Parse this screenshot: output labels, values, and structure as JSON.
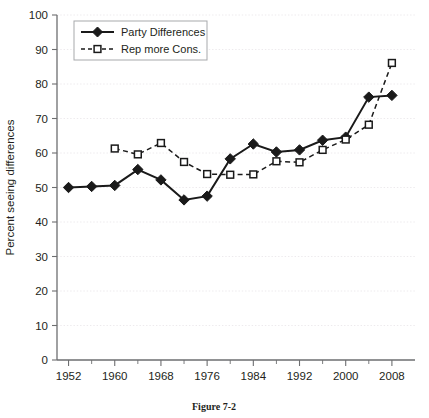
{
  "figure": {
    "caption": "Figure 7-2"
  },
  "chart_data": {
    "type": "line",
    "title": "",
    "xlabel": "",
    "ylabel": "Percent seeing differences",
    "xlim": [
      1950,
      2012
    ],
    "ylim": [
      0,
      100
    ],
    "ytick_step": 10,
    "yticks": [
      0,
      10,
      20,
      30,
      40,
      50,
      60,
      70,
      80,
      90,
      100
    ],
    "ytick_labels": [
      "0",
      "10",
      "20",
      "30",
      "40",
      "50",
      "60",
      "70",
      "80",
      "90",
      "100"
    ],
    "xticks": [
      1952,
      1956,
      1960,
      1964,
      1968,
      1972,
      1976,
      1980,
      1984,
      1988,
      1992,
      1996,
      2000,
      2004,
      2008
    ],
    "xtick_labels_major": [
      "1952",
      "1960",
      "1968",
      "1976",
      "1984",
      "1992",
      "2000",
      "2008"
    ],
    "xticks_major": [
      1952,
      1960,
      1968,
      1976,
      1984,
      1992,
      2000,
      2008
    ],
    "grid": true,
    "grid_axis": "y",
    "legend_position": "top-left",
    "series": [
      {
        "name": "Party Differences",
        "marker": "filled-diamond",
        "linestyle": "solid",
        "color": "#1a1a1a",
        "x": [
          1952,
          1956,
          1960,
          1964,
          1968,
          1972,
          1976,
          1980,
          1984,
          1988,
          1992,
          1996,
          2000,
          2004,
          2008
        ],
        "values": [
          50,
          50.3,
          50.6,
          55.2,
          52.2,
          46.4,
          47.5,
          58.3,
          62.6,
          60.3,
          60.9,
          63.7,
          64.6,
          76.2,
          76.7
        ]
      },
      {
        "name": "Rep more Cons.",
        "marker": "open-square",
        "linestyle": "dashed",
        "color": "#1a1a1a",
        "x": [
          1960,
          1964,
          1968,
          1972,
          1976,
          1980,
          1984,
          1988,
          1992,
          1996,
          2000,
          2004,
          2008
        ],
        "values": [
          61.3,
          59.6,
          62.9,
          57.4,
          53.9,
          53.7,
          53.8,
          57.6,
          57.3,
          60.9,
          63.9,
          68.2,
          86.1
        ]
      }
    ]
  }
}
